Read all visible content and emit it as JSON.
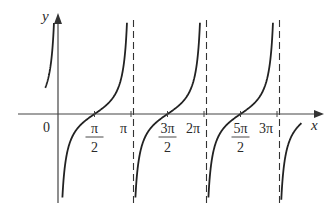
{
  "chart_data": {
    "type": "line",
    "title": "",
    "function": "y = -cot x",
    "xlabel": "x",
    "ylabel": "y",
    "origin_label": "0",
    "x_ticks": [
      {
        "value": 1.5708,
        "label_num": "π",
        "label_den": "2",
        "fraction": true
      },
      {
        "value": 3.1416,
        "label": "π",
        "fraction": false
      },
      {
        "value": 4.7124,
        "label_num": "3π",
        "label_den": "2",
        "fraction": true
      },
      {
        "value": 6.2832,
        "label": "2π",
        "fraction": false
      },
      {
        "value": 7.854,
        "label_num": "5π",
        "label_den": "2",
        "fraction": true
      },
      {
        "value": 9.4248,
        "label": "3π",
        "fraction": false
      }
    ],
    "asymptotes": [
      3.1416,
      6.2832,
      9.4248
    ],
    "asymptote_style": "dashed",
    "zeros": [
      1.5708,
      4.7124,
      7.854
    ],
    "xlim": [
      -0.55,
      3.5
    ],
    "grid": false,
    "legend": null,
    "colors": {
      "curve": "#222222",
      "axis": "#444444",
      "asymptote": "#333333"
    }
  }
}
